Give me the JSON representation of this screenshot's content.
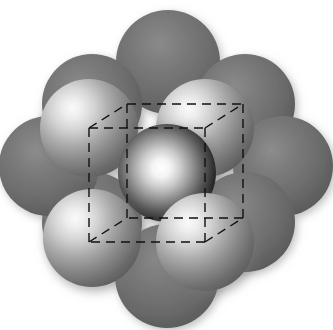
{
  "figure": {
    "canvas": {
      "width": 333,
      "height": 330
    },
    "background_color": "#ffffff"
  },
  "palette": {
    "background": "#ffffff",
    "back_sphere_base": "#6e6e6e",
    "back_sphere_shadow": "#4a4a4a",
    "back_sphere_highlight": "#8f8f8f",
    "front_sphere_highlight": "#f2f2f2",
    "front_sphere_mid": "#9a9a9a",
    "front_sphere_shadow": "#4f4f4f",
    "center_sphere_highlight": "#fbfbfb",
    "center_sphere_rim": "#0d0d0d",
    "wireframe_stroke": "#111111"
  },
  "unit_cell": {
    "label": "unit-cell-cube",
    "stroke_color": "#111111",
    "stroke_width": 1.4,
    "dash_pattern": "9 6",
    "depth_offset": {
      "dx": 38,
      "dy": -24
    },
    "front_face": {
      "top_left": {
        "x": 89,
        "y": 128
      },
      "top_right": {
        "x": 205,
        "y": 128
      },
      "bottom_right": {
        "x": 205,
        "y": 242
      },
      "bottom_left": {
        "x": 89,
        "y": 242
      }
    },
    "back_face": {
      "top_left": {
        "x": 127,
        "y": 104
      },
      "top_right": {
        "x": 243,
        "y": 104
      },
      "bottom_right": {
        "x": 243,
        "y": 218
      },
      "bottom_left": {
        "x": 127,
        "y": 218
      }
    },
    "edges": 12,
    "vertices": 8
  },
  "spheres": {
    "back_layer": {
      "name": "back-layer-spheres",
      "count": 8,
      "radius": 50,
      "shading": "flat-matte",
      "items": [
        {
          "id": "back-top",
          "cx": 168,
          "cy": 62,
          "r": 52
        },
        {
          "id": "back-top-right",
          "cx": 245,
          "cy": 104,
          "r": 50
        },
        {
          "id": "back-right",
          "cx": 283,
          "cy": 166,
          "r": 50
        },
        {
          "id": "back-bottom-right",
          "cx": 245,
          "cy": 222,
          "r": 50
        },
        {
          "id": "back-bottom",
          "cx": 167,
          "cy": 276,
          "r": 52
        },
        {
          "id": "back-bottom-left",
          "cx": 92,
          "cy": 222,
          "r": 50
        },
        {
          "id": "back-left",
          "cx": 49,
          "cy": 166,
          "r": 50
        },
        {
          "id": "back-top-left",
          "cx": 92,
          "cy": 104,
          "r": 50
        }
      ]
    },
    "front_layer": {
      "name": "front-layer-spheres",
      "count": 4,
      "radius": 48,
      "shading": "specular-highlight-upper-left",
      "items": [
        {
          "id": "front-top-left",
          "cx": 89,
          "cy": 128,
          "r": 49
        },
        {
          "id": "front-top-right",
          "cx": 205,
          "cy": 128,
          "r": 49
        },
        {
          "id": "front-bottom-left",
          "cx": 92,
          "cy": 238,
          "r": 49
        },
        {
          "id": "front-bottom-right",
          "cx": 205,
          "cy": 242,
          "r": 49
        }
      ]
    },
    "center": {
      "name": "central-sphere",
      "id": "body-centre",
      "cx": 167,
      "cy": 173,
      "r": 49,
      "shading": "high-contrast-dark-rim"
    }
  },
  "totals": {
    "sphere_count": 13,
    "back_layer_count": 8,
    "front_layer_count": 4,
    "center_count": 1
  }
}
